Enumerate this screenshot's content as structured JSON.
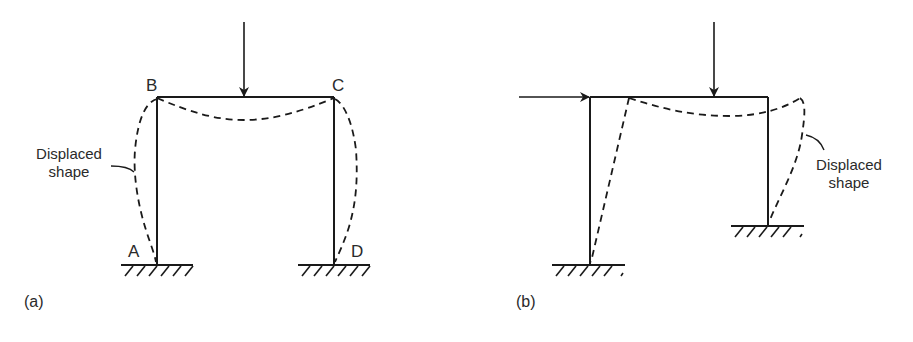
{
  "panels": [
    {
      "id": "a",
      "caption": "(a)",
      "nodes": {
        "A": "A",
        "B": "B",
        "C": "C",
        "D": "D"
      },
      "annotation": {
        "line1": "Displaced",
        "line2": "shape"
      },
      "loads": [
        "vertical point load at beam midspan"
      ],
      "supports": [
        "fixed base at A",
        "fixed base at D"
      ]
    },
    {
      "id": "b",
      "caption": "(b)",
      "annotation": {
        "line1": "Displaced",
        "line2": "shape"
      },
      "loads": [
        "horizontal point load at left beam end",
        "vertical point load on beam"
      ],
      "supports": [
        "fixed base left (lower)",
        "fixed base right (higher)"
      ]
    }
  ],
  "colors": {
    "line": "#1a1a1a",
    "text": "#2a2a2a",
    "background": "#ffffff"
  }
}
